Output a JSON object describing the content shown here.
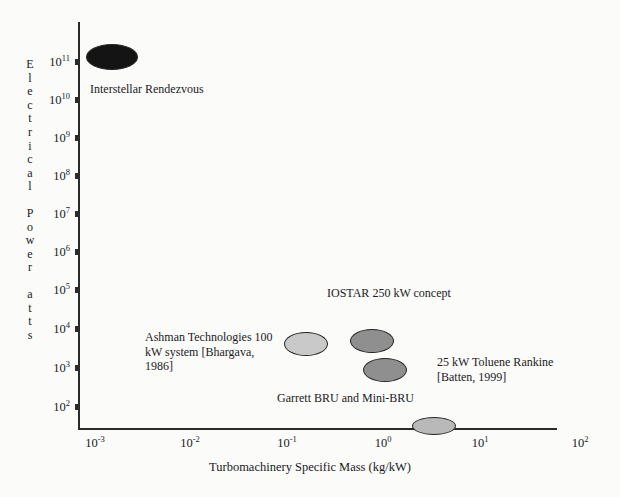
{
  "chart_data": {
    "type": "scatter",
    "title": "",
    "xlabel": "Turbomachinery Specific Mass (kg/kW)",
    "ylabel": "Electrical Power (Watts)",
    "ylabel_chars": [
      "E",
      "l",
      "e",
      "c",
      "t",
      "r",
      "i",
      "c",
      "a",
      "l",
      "",
      "P",
      "o",
      "w",
      "e",
      "r",
      "",
      "a",
      "t",
      "t",
      "s"
    ],
    "xscale": "log",
    "yscale": "log",
    "xlim": [
      0.001,
      100
    ],
    "ylim": [
      50,
      500000000000
    ],
    "grid": false,
    "legend": "none",
    "x_tick_labels": [
      "10-3",
      "10-2",
      "10-1",
      "100",
      "101",
      "102"
    ],
    "x_ticks": [
      {
        "mantissa": "10",
        "exponent": "-3",
        "value": 0.001
      },
      {
        "mantissa": "10",
        "exponent": "-2",
        "value": 0.01
      },
      {
        "mantissa": "10",
        "exponent": "-1",
        "value": 0.1
      },
      {
        "mantissa": "10",
        "exponent": "0",
        "value": 1
      },
      {
        "mantissa": "10",
        "exponent": "1",
        "value": 10
      },
      {
        "mantissa": "10",
        "exponent": "2",
        "value": 100
      }
    ],
    "y_ticks": [
      {
        "mantissa": "10",
        "exponent": "11",
        "value": 100000000000
      },
      {
        "mantissa": "10",
        "exponent": "10",
        "value": 10000000000
      },
      {
        "mantissa": "10",
        "exponent": "9",
        "value": 1000000000
      },
      {
        "mantissa": "10",
        "exponent": "8",
        "value": 100000000
      },
      {
        "mantissa": "10",
        "exponent": "7",
        "value": 10000000
      },
      {
        "mantissa": "10",
        "exponent": "6",
        "value": 1000000
      },
      {
        "mantissa": "10",
        "exponent": "5",
        "value": 100000
      },
      {
        "mantissa": "10",
        "exponent": "4",
        "value": 10000
      },
      {
        "mantissa": "10",
        "exponent": "3",
        "value": 1000
      },
      {
        "mantissa": "10",
        "exponent": "2",
        "value": 100
      }
    ],
    "points": [
      {
        "name": "Interstellar Rendezvous",
        "x": 0.0015,
        "y": 350000000000,
        "fill": "#141414",
        "label": "Interstellar Rendezvous"
      },
      {
        "name": "Ashman Technologies 100 kW system",
        "x": 0.105,
        "y": 4500,
        "fill": "#c9c9c9",
        "label": "Ashman Technologies 100\nkW system [Bhargava,\n1986]"
      },
      {
        "name": "IOSTAR 250 kW concept",
        "x": 0.46,
        "y": 5200,
        "fill": "#8f8f8f",
        "label": "IOSTAR 250 kW concept"
      },
      {
        "name": "Garrett BRU and Mini-BRU",
        "x": 0.82,
        "y": 1100,
        "fill": "#8f8f8f",
        "label": "Garrett BRU and Mini-BRU"
      },
      {
        "name": "25 kW Toluene Rankine",
        "x": 2.8,
        "y": 60,
        "fill": "#b9b9b9",
        "label": "25 kW Toluene Rankine\n[Batten, 1999]"
      }
    ],
    "bubbles": [
      {
        "name": "interstellar-rendezvous-bubble",
        "cx": 112,
        "cy": 57,
        "rx": 25,
        "ry": 12,
        "fill": "#141414"
      },
      {
        "name": "ashman-technologies-bubble",
        "cx": 306,
        "cy": 344,
        "rx": 21,
        "ry": 11,
        "fill": "#c9c9c9"
      },
      {
        "name": "iostar-concept-bubble",
        "cx": 372,
        "cy": 341,
        "rx": 21,
        "ry": 11,
        "fill": "#8f8f8f"
      },
      {
        "name": "garrett-bru-bubble",
        "cx": 385,
        "cy": 370,
        "rx": 21,
        "ry": 11,
        "fill": "#8f8f8f"
      },
      {
        "name": "toluene-rankine-bubble",
        "cx": 434,
        "cy": 426,
        "rx": 21,
        "ry": 8,
        "fill": "#b9b9b9"
      }
    ],
    "annotations": [
      {
        "name": "interstellar-rendezvous-label",
        "text": "Interstellar Rendezvous",
        "x": 90,
        "y": 82,
        "width": 180,
        "align": "left"
      },
      {
        "name": "ashman-technologies-label",
        "text": "Ashman Technologies 100\nkW system [Bhargava,\n1986]",
        "x": 145,
        "y": 330,
        "width": 135,
        "align": "left"
      },
      {
        "name": "iostar-concept-label",
        "text": "IOSTAR 250 kW concept",
        "x": 327,
        "y": 286,
        "width": 170,
        "align": "left"
      },
      {
        "name": "garrett-bru-label",
        "text": "Garrett BRU and Mini-BRU",
        "x": 277,
        "y": 391,
        "width": 180,
        "align": "left"
      },
      {
        "name": "toluene-rankine-label",
        "text": "25 kW Toluene Rankine\n[Batten, 1999]",
        "x": 437,
        "y": 355,
        "width": 140,
        "align": "left"
      }
    ]
  },
  "geometry": {
    "x_pixels": [
      95,
      190,
      287,
      383,
      480,
      580
    ],
    "y_pixels": [
      62,
      100,
      138,
      176,
      214,
      252,
      290,
      329,
      368,
      407
    ]
  }
}
